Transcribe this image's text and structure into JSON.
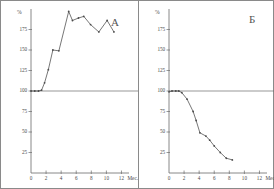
{
  "figure": {
    "background": "#ffffff",
    "border_color": "#8a8a8a",
    "axis_color": "#6b6b6b",
    "line_color": "#4a4a4a"
  },
  "panels": [
    {
      "key": "A",
      "label": "А",
      "y_unit": "%",
      "x_unit": "Мес.",
      "y_ticks": [
        "175",
        "150",
        "125",
        "100",
        "75",
        "50",
        "25"
      ],
      "x_ticks": [
        "0",
        "2",
        "4",
        "6",
        "8",
        "10",
        "12"
      ]
    },
    {
      "key": "B",
      "label": "Б",
      "y_unit": "%",
      "x_unit": "Мес.",
      "y_ticks": [
        "175",
        "150",
        "125",
        "100",
        "75",
        "50",
        "25"
      ],
      "x_ticks": [
        "0",
        "2",
        "4",
        "6",
        "8",
        "10",
        "12"
      ]
    }
  ],
  "chart_data": [
    {
      "type": "line",
      "title": "А",
      "xlabel": "Мес.",
      "ylabel": "%",
      "xlim": [
        0,
        13
      ],
      "ylim": [
        0,
        200
      ],
      "xticks": [
        0,
        2,
        4,
        6,
        8,
        10,
        12
      ],
      "yticks": [
        25,
        50,
        75,
        100,
        125,
        150,
        175
      ],
      "grid": false,
      "legend": "none",
      "baseline": 100,
      "markers": "dot",
      "series": [
        {
          "name": "А",
          "x": [
            0.0,
            0.5,
            1.0,
            1.4,
            1.8,
            2.3,
            2.9,
            3.7,
            5.0,
            5.5,
            6.3,
            7.0,
            7.9,
            9.0,
            10.1,
            11.0
          ],
          "values": [
            100,
            100,
            100,
            101,
            110,
            126,
            150,
            149,
            197,
            186,
            189,
            191,
            181,
            172,
            186,
            172
          ]
        }
      ]
    },
    {
      "type": "line",
      "title": "Б",
      "xlabel": "Мес.",
      "ylabel": "%",
      "xlim": [
        0,
        13
      ],
      "ylim": [
        0,
        200
      ],
      "xticks": [
        0,
        2,
        4,
        6,
        8,
        10,
        12
      ],
      "yticks": [
        25,
        50,
        75,
        100,
        125,
        150,
        175
      ],
      "grid": false,
      "legend": "none",
      "baseline": 100,
      "markers": "dot",
      "series": [
        {
          "name": "Б",
          "x": [
            0.0,
            0.4,
            0.9,
            1.3,
            1.7,
            2.4,
            3.2,
            3.6,
            4.1,
            4.9,
            5.4,
            6.0,
            6.8,
            7.6,
            8.4
          ],
          "values": [
            99,
            100,
            100,
            100,
            98,
            90,
            75,
            64,
            49,
            45,
            40,
            33,
            25,
            18,
            16
          ]
        }
      ]
    }
  ]
}
